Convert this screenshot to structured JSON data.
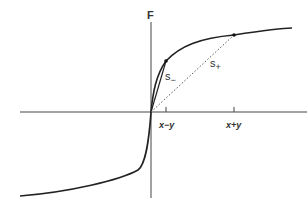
{
  "diagram": {
    "axis_label_y": "F",
    "secant_labels": {
      "s_minus": "s",
      "s_minus_sub": "−",
      "s_plus": "s",
      "s_plus_sub": "+"
    },
    "tick_labels": {
      "x_minus_y": "x−y",
      "x_plus_y": "x+y"
    },
    "colors": {
      "curve": "#222222",
      "axes": "#444444",
      "dotted": "#555555"
    }
  }
}
